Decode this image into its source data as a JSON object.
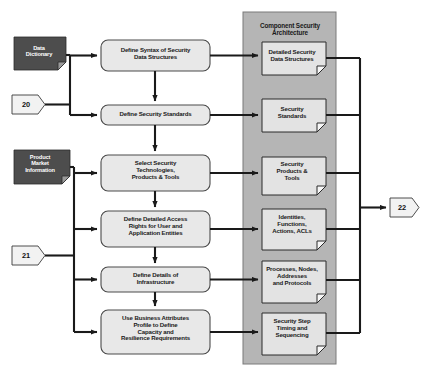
{
  "diagram": {
    "colors": {
      "source_fill": "#4d4d4d",
      "source_text": "#ffffff",
      "process_fill": "#e8e8e8",
      "process_stroke": "#4a4a4a",
      "panel_fill": "#b5b5b5",
      "panel_stroke": "#7a7a7a",
      "document_fill": "#e3e3e3",
      "document_stroke": "#2b2b2b",
      "connector_fill": "#f2f2f2",
      "line": "#1a1a1a",
      "background": "#ffffff"
    },
    "panel": {
      "label": "panel-component-security-architecture",
      "title_line1": "Component Security",
      "title_line2": "Architecture"
    },
    "sources": [
      {
        "id": "data-dictionary",
        "lines": [
          "Data",
          "Dictionary"
        ]
      },
      {
        "id": "product-market-information",
        "lines": [
          "Product",
          "Market",
          "Information"
        ]
      }
    ],
    "off_page_connectors": [
      {
        "id": "connector-20",
        "label": "20"
      },
      {
        "id": "connector-21",
        "label": "21"
      },
      {
        "id": "connector-22",
        "label": "22"
      }
    ],
    "process_steps": [
      {
        "id": "define-syntax-of-security-data-structures",
        "lines": [
          "Define Syntax of Security",
          "Data Structures"
        ]
      },
      {
        "id": "define-security-standards",
        "lines": [
          "Define Security Standards"
        ]
      },
      {
        "id": "select-security-technologies-products-tools",
        "lines": [
          "Select Security",
          "Technologies,",
          "Products & Tools"
        ]
      },
      {
        "id": "define-detailed-access-rights",
        "lines": [
          "Define Detailed Access",
          "Rights for User and",
          "Application Entities"
        ]
      },
      {
        "id": "define-details-of-infrastructure",
        "lines": [
          "Define Details of",
          "Infrastructure"
        ]
      },
      {
        "id": "use-business-attributes-profile",
        "lines": [
          "Use Business Attributes",
          "Profile to Define",
          "Capacity and",
          "Resilience Requirements"
        ]
      }
    ],
    "outputs": [
      {
        "id": "detailed-security-data-structures",
        "lines": [
          "Detailed Security",
          "Data Structures"
        ]
      },
      {
        "id": "security-standards",
        "lines": [
          "Security",
          "Standards"
        ]
      },
      {
        "id": "security-products-tools",
        "lines": [
          "Security",
          "Products &",
          "Tools"
        ]
      },
      {
        "id": "identities-functions-actions-acls",
        "lines": [
          "Identities,",
          "Functions,",
          "Actions, ACLs"
        ]
      },
      {
        "id": "processes-nodes-addresses-protocols",
        "lines": [
          "Processes, Nodes,",
          "Addresses",
          "and Protocols"
        ]
      },
      {
        "id": "security-step-timing-sequencing",
        "lines": [
          "Security Step",
          "Timing and",
          "Sequencing"
        ]
      }
    ]
  }
}
